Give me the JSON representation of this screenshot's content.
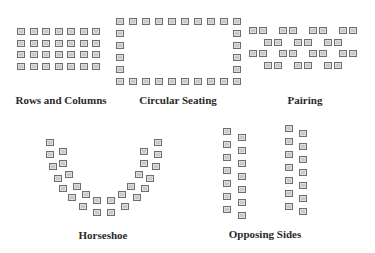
{
  "colors": {
    "seat_fill": "#c9c9c9",
    "seat_border": "#6e6e6e",
    "label": "#2a2a2a",
    "background": "#ffffff"
  },
  "arrangements": [
    {
      "id": "rows",
      "label": "Rows and Columns",
      "label_pos": [
        61,
        94
      ],
      "layout": {
        "type": "grid",
        "rows": 4,
        "cols": 7,
        "x0": 17,
        "y0": 28,
        "dx": 12.5,
        "dy": 11.5
      }
    },
    {
      "id": "circular",
      "label": "Circular Seating",
      "label_pos": [
        178,
        94
      ],
      "layout": {
        "type": "rectangle",
        "top_count": 10,
        "side_count": 4,
        "x0": 116,
        "y0": 18,
        "dx": 13,
        "dy": 12,
        "bottom_y": 78
      }
    },
    {
      "id": "pairing",
      "label": "Pairing",
      "label_pos": [
        305,
        94
      ],
      "layout": {
        "type": "pairs",
        "rows": [
          {
            "y": 27,
            "x": [
              249,
              279,
              309,
              339
            ]
          },
          {
            "y": 39,
            "x": [
              264,
              294,
              324
            ]
          },
          {
            "y": 50,
            "x": [
              249,
              279,
              309,
              339
            ]
          },
          {
            "y": 62,
            "x": [
              264,
              294,
              324
            ]
          }
        ],
        "pair_gap": 10
      }
    },
    {
      "id": "horseshoe",
      "label": "Horseshoe",
      "label_pos": [
        103,
        229
      ],
      "layout": {
        "type": "points",
        "points": [
          [
            46,
            139
          ],
          [
            46,
            151
          ],
          [
            49,
            163
          ],
          [
            54,
            175
          ],
          [
            59,
            185
          ],
          [
            68,
            194
          ],
          [
            79,
            203
          ],
          [
            93,
            209
          ],
          [
            59,
            148
          ],
          [
            59,
            160
          ],
          [
            65,
            171
          ],
          [
            73,
            183
          ],
          [
            82,
            191
          ],
          [
            93,
            197
          ],
          [
            107,
            197
          ],
          [
            118,
            191
          ],
          [
            127,
            183
          ],
          [
            135,
            171
          ],
          [
            140,
            160
          ],
          [
            140,
            148
          ],
          [
            107,
            209
          ],
          [
            121,
            203
          ],
          [
            133,
            194
          ],
          [
            141,
            185
          ],
          [
            146,
            175
          ],
          [
            152,
            163
          ],
          [
            154,
            151
          ],
          [
            154,
            139
          ]
        ]
      }
    },
    {
      "id": "opposing",
      "label": "Opposing Sides",
      "label_pos": [
        265,
        228
      ],
      "layout": {
        "type": "columns",
        "count": 7,
        "dy": 13,
        "columns": [
          {
            "x": 223,
            "y0": 128
          },
          {
            "x": 238,
            "y0": 134
          },
          {
            "x": 285,
            "y0": 125
          },
          {
            "x": 299,
            "y0": 130
          }
        ]
      }
    }
  ]
}
